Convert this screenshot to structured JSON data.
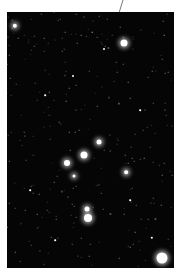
{
  "image": {
    "subject": "star field",
    "background_color": "#050505",
    "frame_color": "#ffffff",
    "stars": [
      {
        "x": 15,
        "y": 26,
        "r": 2.2,
        "glow": true
      },
      {
        "x": 124,
        "y": 43,
        "r": 3.5,
        "glow": true
      },
      {
        "x": 104,
        "y": 49,
        "r": 1,
        "glow": false
      },
      {
        "x": 73,
        "y": 76,
        "r": 1,
        "glow": false
      },
      {
        "x": 99,
        "y": 142,
        "r": 2.5,
        "glow": true
      },
      {
        "x": 84,
        "y": 155,
        "r": 3.5,
        "glow": true
      },
      {
        "x": 67,
        "y": 163,
        "r": 3,
        "glow": true
      },
      {
        "x": 74,
        "y": 176,
        "r": 1.5,
        "glow": true
      },
      {
        "x": 126,
        "y": 172,
        "r": 1.8,
        "glow": true
      },
      {
        "x": 87,
        "y": 209,
        "r": 2.5,
        "glow": true
      },
      {
        "x": 88,
        "y": 218,
        "r": 4,
        "glow": true
      },
      {
        "x": 152,
        "y": 238,
        "r": 1.2,
        "glow": false
      },
      {
        "x": 162,
        "y": 258,
        "r": 5.5,
        "glow": true
      },
      {
        "x": 45,
        "y": 95,
        "r": 0.8,
        "glow": false
      },
      {
        "x": 140,
        "y": 110,
        "r": 0.8,
        "glow": false
      },
      {
        "x": 30,
        "y": 190,
        "r": 0.8,
        "glow": false
      },
      {
        "x": 130,
        "y": 200,
        "r": 0.8,
        "glow": false
      },
      {
        "x": 55,
        "y": 240,
        "r": 0.8,
        "glow": false
      }
    ],
    "leader_line": {
      "x1": 123,
      "y1": 0,
      "x2": 119,
      "y2": 12
    }
  }
}
